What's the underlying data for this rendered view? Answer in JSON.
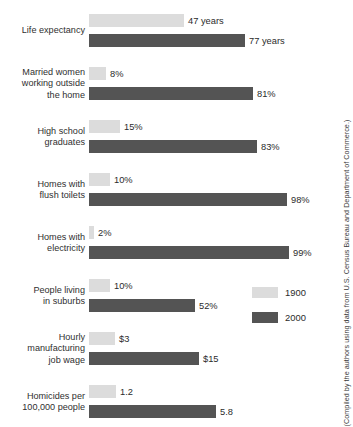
{
  "chart_data": {
    "type": "bar",
    "orientation": "horizontal",
    "title": "",
    "xlabel": "",
    "ylabel": "",
    "grid": false,
    "legend_position": "right-middle",
    "legend": [
      {
        "name": "1900",
        "color": "#dcdcdc"
      },
      {
        "name": "2000",
        "color": "#545454"
      }
    ],
    "categories": [
      "Life expectancy",
      "Married women working outside the home",
      "High school graduates",
      "Homes with flush toilets",
      "Homes with electricity",
      "People living in suburbs",
      "Hourly manufacturing job wage",
      "Homicides per 100,000 people"
    ],
    "series": [
      {
        "name": "1900",
        "values": [
          47,
          8,
          15,
          10,
          2,
          10,
          3,
          1.2
        ],
        "labels": [
          "47 years",
          "8%",
          "15%",
          "10%",
          "2%",
          "10%",
          "$3",
          "1.2"
        ]
      },
      {
        "name": "2000",
        "values": [
          77,
          81,
          83,
          98,
          99,
          52,
          15,
          5.8
        ],
        "labels": [
          "77 years",
          "81%",
          "83%",
          "98%",
          "99%",
          "52%",
          "$15",
          "5.8"
        ]
      }
    ],
    "units": [
      "years",
      "percent",
      "percent",
      "percent",
      "percent",
      "percent",
      "dollars",
      "rate per 100,000"
    ],
    "source": "(Compiled by the authors using data from U.S. Census Bureau and Department of Commerce.)"
  },
  "rows": [
    {
      "label": "Life expectancy",
      "bar1900": {
        "value_label": "47 years",
        "width": 95
      },
      "bar2000": {
        "value_label": "77 years",
        "width": 156
      }
    },
    {
      "label": "Married women\nworking outside\nthe home",
      "bar1900": {
        "value_label": "8%",
        "width": 17
      },
      "bar2000": {
        "value_label": "81%",
        "width": 164
      }
    },
    {
      "label": "High school\ngraduates",
      "bar1900": {
        "value_label": "15%",
        "width": 31
      },
      "bar2000": {
        "value_label": "83%",
        "width": 168
      }
    },
    {
      "label": "Homes with\nflush toilets",
      "bar1900": {
        "value_label": "10%",
        "width": 21
      },
      "bar2000": {
        "value_label": "98%",
        "width": 198
      }
    },
    {
      "label": "Homes with\nelectricity",
      "bar1900": {
        "value_label": "2%",
        "width": 5
      },
      "bar2000": {
        "value_label": "99%",
        "width": 200
      }
    },
    {
      "label": "People living\nin suburbs",
      "bar1900": {
        "value_label": "10%",
        "width": 21
      },
      "bar2000": {
        "value_label": "52%",
        "width": 106
      }
    },
    {
      "label": "Hourly\nmanufacturing\njob wage",
      "bar1900": {
        "value_label": "$3",
        "width": 26
      },
      "bar2000": {
        "value_label": "$15",
        "width": 110
      }
    },
    {
      "label": "Homicides per\n100,000 people",
      "bar1900": {
        "value_label": "1.2",
        "width": 27
      },
      "bar2000": {
        "value_label": "5.8",
        "width": 127
      }
    }
  ],
  "legend": {
    "items": [
      {
        "label": "1900"
      },
      {
        "label": "2000"
      }
    ]
  },
  "source_note": "(Compiled by the authors using data from U.S. Census Bureau and Department of Commerce.)",
  "bottom_strip": ""
}
